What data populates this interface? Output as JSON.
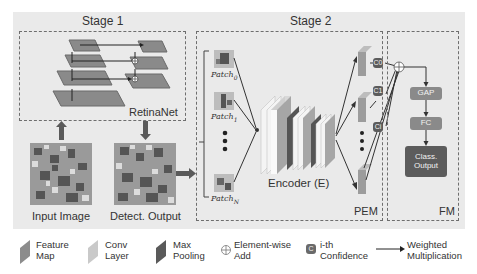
{
  "stage1": {
    "title": "Stage 1",
    "network_label": "RetinaNet",
    "input_label": "Input Image",
    "output_label": "Detect. Output"
  },
  "stage2": {
    "title": "Stage 2",
    "patches": [
      {
        "base": "Patch",
        "sub": "0"
      },
      {
        "base": "Patch",
        "sub": "1"
      },
      {
        "base": "Patch",
        "sub": "N"
      }
    ],
    "encoder_label": "Encoder (E)",
    "pem_label": "PEM",
    "confidence_labels": [
      "C0",
      "C1",
      "Ci"
    ]
  },
  "fm": {
    "label": "FM",
    "blocks": [
      "GAP",
      "FC",
      "Class. Output"
    ]
  },
  "legend": [
    {
      "icon": "feature-map",
      "line1": "Feature",
      "line2": "Map"
    },
    {
      "icon": "conv-layer",
      "line1": "Conv",
      "line2": "Layer"
    },
    {
      "icon": "max-pooling",
      "line1": "Max",
      "line2": "Pooling"
    },
    {
      "icon": "element-wise-add",
      "line1": "Element-wise",
      "line2": "Add"
    },
    {
      "icon": "confidence",
      "line1": "i-th",
      "line2": "Confidence"
    },
    {
      "icon": "weighted-multiplication",
      "line1": "Weighted",
      "line2": "Multiplication"
    }
  ],
  "colors": {
    "panel_bg": "#eaeaea",
    "feature_map": "#8c8c8c",
    "conv_layer": "#c9c9c9",
    "max_pooling": "#5a5a5a",
    "gap_fc": "#8a8a8a",
    "class_output": "#5c5c5c"
  }
}
